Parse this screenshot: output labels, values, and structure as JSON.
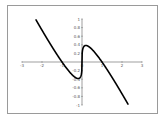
{
  "chart_data": {
    "type": "line",
    "title": "",
    "xlabel": "",
    "ylabel": "",
    "function": "y = x^(1/3) - x",
    "xlim": [
      -3,
      3
    ],
    "ylim": [
      -1,
      1
    ],
    "x_ticks": [
      "-3",
      "-2",
      "-1",
      "0",
      "1",
      "2",
      "3"
    ],
    "y_ticks": [
      "1",
      "0.8",
      "0.6",
      "0.4",
      "0.2",
      "-0.2",
      "-0.4",
      "-0.6",
      "-0.8",
      "-1"
    ],
    "grid": false,
    "legend": null,
    "series": [
      {
        "name": "curve",
        "color": "#000000",
        "x": [
          -2.3,
          -2.0,
          -1.5,
          -1.0,
          -0.5,
          -0.2,
          -0.1,
          -0.05,
          0,
          0.05,
          0.1,
          0.19,
          0.5,
          1.0,
          1.5,
          2.0,
          2.3
        ],
        "y": [
          1.0,
          0.74,
          0.36,
          0.0,
          -0.29,
          -0.38,
          -0.36,
          -0.32,
          0,
          0.32,
          0.36,
          0.38,
          0.29,
          0.0,
          -0.36,
          -0.74,
          -1.0
        ]
      }
    ]
  },
  "colors": {
    "frame": "#9a9a9a",
    "axis": "#777777",
    "curve": "#000000",
    "background": "#ffffff"
  }
}
